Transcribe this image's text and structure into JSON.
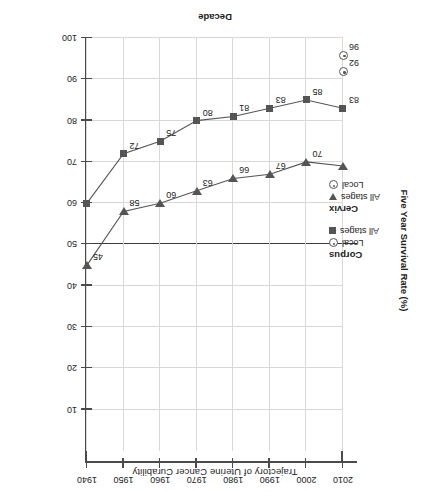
{
  "chart_data": {
    "type": "line",
    "title": "Trajectory of Uterine Cancer Curability",
    "xlabel": "Decade",
    "ylabel": "Five Year Survival Rate (%)",
    "x": [
      1940,
      1950,
      1960,
      1970,
      1980,
      1990,
      2000,
      2010
    ],
    "xtick_labels": [
      "1940",
      "1950",
      "1960",
      "1970",
      "1980",
      "1990",
      "2000",
      "2010"
    ],
    "xlim": [
      1940,
      2010
    ],
    "ylim": [
      0,
      100
    ],
    "y_inverted": true,
    "ytick_labels": [
      "10",
      "20",
      "30",
      "40",
      "50",
      "60",
      "70",
      "80",
      "90",
      "100"
    ],
    "ytick_values": [
      10,
      20,
      30,
      40,
      50,
      60,
      70,
      80,
      90,
      100
    ],
    "grid": true,
    "reference_line": {
      "value": 50,
      "color": "#3a3a3a"
    },
    "legend_position": "inside-left",
    "rotation_degrees": 180,
    "series": [
      {
        "name": "Corpus All stages",
        "group": "Corpus",
        "stage": "All stages",
        "marker": "square",
        "color": "#555555",
        "values": [
          60,
          72,
          75,
          80,
          81,
          83,
          85,
          83
        ],
        "point_labels": [
          "",
          "72",
          "75",
          "80",
          "81",
          "83",
          "85",
          "83"
        ]
      },
      {
        "name": "Cervix All stages",
        "group": "Cervix",
        "stage": "All stages",
        "marker": "triangle-down",
        "color": "#555555",
        "values": [
          45,
          58,
          60,
          63,
          66,
          67,
          70,
          69
        ],
        "point_labels": [
          "45",
          "58",
          "60",
          "63",
          "66",
          "67",
          "70",
          ""
        ]
      },
      {
        "name": "Corpus Local",
        "group": "Corpus",
        "stage": "Local",
        "marker": "circle-dot",
        "color": "#555555",
        "x": [
          2010
        ],
        "values": [
          96
        ],
        "point_labels": [
          "96"
        ]
      },
      {
        "name": "Cervix Local",
        "group": "Cervix",
        "stage": "Local",
        "marker": "circle-dot",
        "color": "#555555",
        "x": [
          2010
        ],
        "values": [
          92
        ],
        "point_labels": [
          "92"
        ]
      }
    ]
  },
  "legend": {
    "groups": [
      {
        "title": "Corpus",
        "entries": [
          {
            "symbol": "circle-dot",
            "label": "Local"
          },
          {
            "symbol": "square",
            "label": "All stages"
          }
        ]
      },
      {
        "title": "Cervix",
        "entries": [
          {
            "symbol": "triangle-down",
            "label": "All stages"
          },
          {
            "symbol": "circle-dot",
            "label": "Local"
          }
        ]
      }
    ]
  }
}
